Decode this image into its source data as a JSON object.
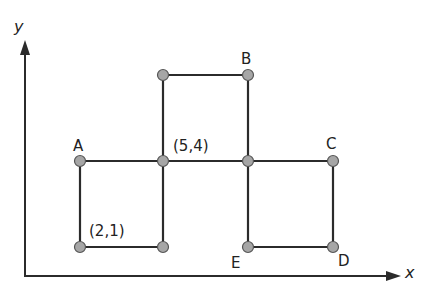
{
  "diagram": {
    "axes": {
      "x_label": "x",
      "y_label": "y"
    },
    "colors": {
      "line": "#2b2b2b",
      "node_fill": "#a6a6a6",
      "node_stroke": "#555555",
      "background": "#ffffff"
    },
    "labels": {
      "A": "A",
      "B": "B",
      "C": "C",
      "D": "D",
      "E": "E",
      "center_coord": "(5,4)",
      "lower_left_coord": "(2,1)"
    },
    "nodes": [
      {
        "id": "top-left",
        "x": 163,
        "y": 75
      },
      {
        "id": "B",
        "x": 248,
        "y": 75
      },
      {
        "id": "A",
        "x": 80,
        "y": 161
      },
      {
        "id": "center-5-4",
        "x": 163,
        "y": 161
      },
      {
        "id": "mid-right",
        "x": 248,
        "y": 161
      },
      {
        "id": "C",
        "x": 333,
        "y": 161
      },
      {
        "id": "point-2-1",
        "x": 80,
        "y": 247
      },
      {
        "id": "bottom-mid-left",
        "x": 163,
        "y": 247
      },
      {
        "id": "E",
        "x": 248,
        "y": 247
      },
      {
        "id": "D",
        "x": 333,
        "y": 247
      }
    ]
  }
}
